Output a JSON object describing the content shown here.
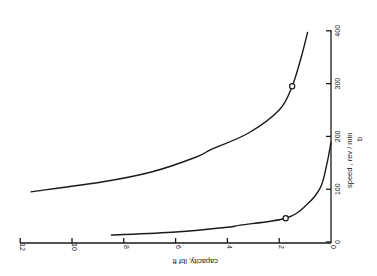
{
  "chart_data": {
    "type": "line",
    "title": "",
    "orientation_note": "figure is rotated 90 degrees clockwise on the page",
    "panel_label": "b",
    "xlabel": "speed , rev / min",
    "ylabel": "capacity, lbf ft",
    "xlim": [
      0,
      400
    ],
    "ylim": [
      0,
      12
    ],
    "x_ticks": [
      0,
      100,
      200,
      300,
      400
    ],
    "y_ticks": [
      0,
      2,
      4,
      6,
      8,
      10,
      12
    ],
    "grid": false,
    "legend": null,
    "series": [
      {
        "name": "upper curve",
        "points": [
          {
            "speed": 398,
            "capacity": 0.9
          },
          {
            "speed": 350,
            "capacity": 1.15
          },
          {
            "speed": 295,
            "capacity": 1.5
          },
          {
            "speed": 250,
            "capacity": 2.0
          },
          {
            "speed": 206,
            "capacity": 3.2
          },
          {
            "speed": 176,
            "capacity": 4.6
          },
          {
            "speed": 161,
            "capacity": 5.2
          },
          {
            "speed": 133,
            "capacity": 6.9
          },
          {
            "speed": 114,
            "capacity": 8.8
          },
          {
            "speed": 95,
            "capacity": 11.6
          }
        ],
        "marked_point": {
          "speed": 295,
          "capacity": 1.5
        }
      },
      {
        "name": "lower curve",
        "points": [
          {
            "speed": 189,
            "capacity": 0.0
          },
          {
            "speed": 150,
            "capacity": 0.15
          },
          {
            "speed": 104,
            "capacity": 0.4
          },
          {
            "speed": 70,
            "capacity": 0.95
          },
          {
            "speed": 45,
            "capacity": 1.75
          },
          {
            "speed": 32,
            "capacity": 3.5
          },
          {
            "speed": 28,
            "capacity": 4.0
          },
          {
            "speed": 19,
            "capacity": 6.0
          },
          {
            "speed": 13,
            "capacity": 8.5
          }
        ],
        "marked_point": {
          "speed": 45,
          "capacity": 1.75
        }
      }
    ]
  },
  "labels": {
    "x_ticks": [
      "0",
      "100",
      "200",
      "300",
      "400"
    ],
    "y_ticks": [
      "0",
      "2",
      "4",
      "6",
      "8",
      "10",
      "12"
    ],
    "xlabel": "speed , rev / min",
    "ylabel": "capacity, lbf ft",
    "panel": "b"
  }
}
